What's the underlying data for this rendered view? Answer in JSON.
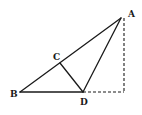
{
  "diagram": {
    "title": "",
    "points": {
      "A": {
        "label": "A",
        "x": 121,
        "y": 18,
        "lx": 128,
        "ly": 17
      },
      "B": {
        "label": "B",
        "x": 20,
        "y": 92,
        "lx": 10,
        "ly": 96
      },
      "C": {
        "label": "C",
        "x": 60,
        "y": 63,
        "lx": 53,
        "ly": 59
      },
      "D": {
        "label": "D",
        "x": 83,
        "y": 92,
        "lx": 80,
        "ly": 104
      },
      "E": {
        "label": "",
        "x": 124,
        "y": 92
      }
    },
    "segments_solid": [
      [
        "A",
        "B"
      ],
      [
        "B",
        "D"
      ],
      [
        "A",
        "D"
      ],
      [
        "C",
        "D"
      ]
    ],
    "segments_dashed": [
      [
        "A",
        "E"
      ],
      [
        "D",
        "E"
      ]
    ],
    "colors": {
      "stroke": "#1a1a1a",
      "background": "#ffffff"
    }
  }
}
